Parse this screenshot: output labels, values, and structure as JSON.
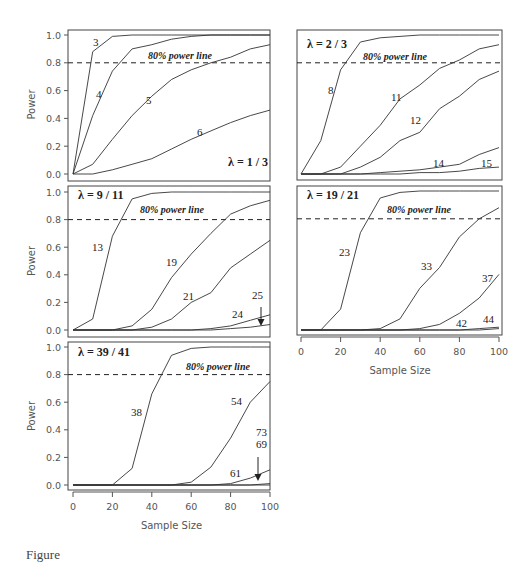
{
  "figure": {
    "x_axis_title": "Sample Size",
    "y_axis_title": "Power",
    "power_line_label": "80% power line",
    "caption_partial": "Figure"
  },
  "chart_data": [
    {
      "type": "line",
      "title": "λ = 1 / 3",
      "xlabel": "Sample Size",
      "ylabel": "Power",
      "xlim": [
        0,
        100
      ],
      "ylim": [
        0,
        1
      ],
      "x_ticks": [
        0,
        20,
        40,
        60,
        80,
        100
      ],
      "y_ticks": [
        0.0,
        0.2,
        0.4,
        0.6,
        0.8,
        1.0
      ],
      "reference_line": {
        "y": 0.8,
        "label": "80% power line",
        "style": "dashed"
      },
      "x": [
        0,
        10,
        20,
        30,
        40,
        50,
        60,
        70,
        80,
        90,
        100
      ],
      "series": [
        {
          "name": "3",
          "values": [
            0,
            0.88,
            0.99,
            1.0,
            1.0,
            1.0,
            1.0,
            1.0,
            1.0,
            1.0,
            1.0
          ]
        },
        {
          "name": "4",
          "values": [
            0,
            0.42,
            0.74,
            0.9,
            0.93,
            0.97,
            0.99,
            1.0,
            1.0,
            1.0,
            1.0
          ]
        },
        {
          "name": "5",
          "values": [
            0,
            0.07,
            0.25,
            0.42,
            0.56,
            0.68,
            0.75,
            0.8,
            0.84,
            0.9,
            0.93
          ]
        },
        {
          "name": "6",
          "values": [
            0,
            0.0,
            0.03,
            0.07,
            0.11,
            0.18,
            0.25,
            0.31,
            0.37,
            0.42,
            0.46
          ]
        }
      ]
    },
    {
      "type": "line",
      "title": "λ = 2 / 3",
      "xlabel": "Sample Size",
      "ylabel": "Power",
      "xlim": [
        0,
        100
      ],
      "ylim": [
        0,
        1
      ],
      "x_ticks": [
        0,
        20,
        40,
        60,
        80,
        100
      ],
      "y_ticks": [
        0.0,
        0.2,
        0.4,
        0.6,
        0.8,
        1.0
      ],
      "reference_line": {
        "y": 0.8,
        "label": "80% power line",
        "style": "dashed"
      },
      "x": [
        0,
        10,
        20,
        30,
        40,
        50,
        60,
        70,
        80,
        90,
        100
      ],
      "series": [
        {
          "name": "8",
          "values": [
            0,
            0.24,
            0.75,
            0.95,
            0.98,
            0.99,
            1.0,
            1.0,
            1.0,
            1.0,
            1.0
          ]
        },
        {
          "name": "11",
          "values": [
            0,
            0.0,
            0.05,
            0.2,
            0.35,
            0.54,
            0.64,
            0.76,
            0.82,
            0.9,
            0.93
          ]
        },
        {
          "name": "12",
          "values": [
            0,
            0.0,
            0.0,
            0.05,
            0.12,
            0.24,
            0.3,
            0.47,
            0.56,
            0.68,
            0.74
          ]
        },
        {
          "name": "14",
          "values": [
            0,
            0.0,
            0.0,
            0.0,
            0.01,
            0.02,
            0.03,
            0.05,
            0.07,
            0.14,
            0.19
          ]
        },
        {
          "name": "15",
          "values": [
            0,
            0.0,
            0.0,
            0.0,
            0.0,
            0.0,
            0.01,
            0.01,
            0.02,
            0.04,
            0.05
          ]
        }
      ]
    },
    {
      "type": "line",
      "title": "λ = 9 / 11",
      "xlabel": "Sample Size",
      "ylabel": "Power",
      "xlim": [
        0,
        100
      ],
      "ylim": [
        0,
        1
      ],
      "x_ticks": [
        0,
        20,
        40,
        60,
        80,
        100
      ],
      "y_ticks": [
        0.0,
        0.2,
        0.4,
        0.6,
        0.8,
        1.0
      ],
      "reference_line": {
        "y": 0.8,
        "label": "80% power line",
        "style": "dashed"
      },
      "x": [
        0,
        10,
        20,
        30,
        40,
        50,
        60,
        70,
        80,
        90,
        100
      ],
      "series": [
        {
          "name": "13",
          "values": [
            0,
            0.08,
            0.68,
            0.95,
            0.99,
            1.0,
            1.0,
            1.0,
            1.0,
            1.0,
            1.0
          ]
        },
        {
          "name": "19",
          "values": [
            0,
            0.0,
            0.0,
            0.03,
            0.15,
            0.38,
            0.55,
            0.7,
            0.84,
            0.9,
            0.94
          ]
        },
        {
          "name": "21",
          "values": [
            0,
            0.0,
            0.0,
            0.0,
            0.02,
            0.08,
            0.2,
            0.27,
            0.45,
            0.55,
            0.65
          ]
        },
        {
          "name": "24",
          "values": [
            0,
            0.0,
            0.0,
            0.0,
            0.0,
            0.0,
            0.0,
            0.01,
            0.03,
            0.07,
            0.11
          ]
        },
        {
          "name": "25",
          "values": [
            0,
            0.0,
            0.0,
            0.0,
            0.0,
            0.0,
            0.0,
            0.0,
            0.01,
            0.02,
            0.04
          ]
        }
      ]
    },
    {
      "type": "line",
      "title": "λ = 19 / 21",
      "xlabel": "Sample Size",
      "ylabel": "Power",
      "xlim": [
        0,
        100
      ],
      "ylim": [
        0,
        1
      ],
      "x_ticks": [
        0,
        20,
        40,
        60,
        80,
        100
      ],
      "y_ticks": [
        0.0,
        0.2,
        0.4,
        0.6,
        0.8,
        1.0
      ],
      "reference_line": {
        "y": 0.8,
        "label": "80% power line",
        "style": "dashed"
      },
      "x": [
        0,
        10,
        20,
        30,
        40,
        50,
        60,
        70,
        80,
        90,
        100
      ],
      "series": [
        {
          "name": "23",
          "values": [
            0,
            0.0,
            0.15,
            0.7,
            0.95,
            0.99,
            1.0,
            1.0,
            1.0,
            1.0,
            1.0
          ]
        },
        {
          "name": "33",
          "values": [
            0,
            0.0,
            0.0,
            0.0,
            0.01,
            0.08,
            0.3,
            0.45,
            0.67,
            0.8,
            0.88
          ]
        },
        {
          "name": "37",
          "values": [
            0,
            0.0,
            0.0,
            0.0,
            0.0,
            0.0,
            0.01,
            0.04,
            0.12,
            0.23,
            0.4
          ]
        },
        {
          "name": "42",
          "values": [
            0,
            0.0,
            0.0,
            0.0,
            0.0,
            0.0,
            0.0,
            0.0,
            0.0,
            0.01,
            0.02
          ]
        },
        {
          "name": "44",
          "values": [
            0,
            0.0,
            0.0,
            0.0,
            0.0,
            0.0,
            0.0,
            0.0,
            0.0,
            0.0,
            0.01
          ]
        }
      ]
    },
    {
      "type": "line",
      "title": "λ = 39 / 41",
      "xlabel": "Sample Size",
      "ylabel": "Power",
      "xlim": [
        0,
        100
      ],
      "ylim": [
        0,
        1
      ],
      "x_ticks": [
        0,
        20,
        40,
        60,
        80,
        100
      ],
      "y_ticks": [
        0.0,
        0.2,
        0.4,
        0.6,
        0.8,
        1.0
      ],
      "reference_line": {
        "y": 0.8,
        "label": "80% power line",
        "style": "dashed"
      },
      "x": [
        0,
        10,
        20,
        30,
        40,
        50,
        60,
        70,
        80,
        90,
        100
      ],
      "series": [
        {
          "name": "38",
          "values": [
            0,
            0.0,
            0.0,
            0.12,
            0.66,
            0.94,
            0.99,
            1.0,
            1.0,
            1.0,
            1.0
          ]
        },
        {
          "name": "54",
          "values": [
            0,
            0.0,
            0.0,
            0.0,
            0.0,
            0.0,
            0.02,
            0.13,
            0.34,
            0.6,
            0.75
          ]
        },
        {
          "name": "61",
          "values": [
            0,
            0.0,
            0.0,
            0.0,
            0.0,
            0.0,
            0.0,
            0.0,
            0.01,
            0.05,
            0.11
          ]
        },
        {
          "name": "69",
          "values": [
            0,
            0.0,
            0.0,
            0.0,
            0.0,
            0.0,
            0.0,
            0.0,
            0.0,
            0.0,
            0.01
          ]
        },
        {
          "name": "73",
          "values": [
            0,
            0.0,
            0.0,
            0.0,
            0.0,
            0.0,
            0.0,
            0.0,
            0.0,
            0.0,
            0.0
          ]
        }
      ]
    }
  ],
  "panels": [
    {
      "lambda_label": "λ = 1 / 3",
      "labels": [
        "3",
        "4",
        "5",
        "6"
      ]
    },
    {
      "lambda_label": "λ = 2 / 3",
      "labels": [
        "8",
        "11",
        "12",
        "14",
        "15"
      ]
    },
    {
      "lambda_label": "λ = 9 / 11",
      "labels": [
        "13",
        "19",
        "21",
        "24",
        "25"
      ]
    },
    {
      "lambda_label": "λ = 19 / 21",
      "labels": [
        "23",
        "33",
        "37",
        "42",
        "44"
      ]
    },
    {
      "lambda_label": "λ = 39 / 41",
      "labels": [
        "38",
        "54",
        "73",
        "69",
        "61"
      ]
    }
  ]
}
